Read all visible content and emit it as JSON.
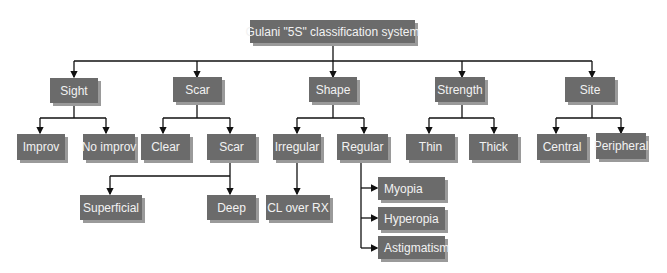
{
  "diagram": {
    "title": "Gulani \"5S\" classification system",
    "colors": {
      "box_fill": "#6b6b6b",
      "box_text": "#f2f2f2",
      "box_shadow": "#9a9a9a",
      "line": "#111111"
    },
    "categories": [
      {
        "label": "Sight",
        "children": [
          {
            "label": "Improv"
          },
          {
            "label": "No improv"
          }
        ]
      },
      {
        "label": "Scar",
        "children": [
          {
            "label": "Clear"
          },
          {
            "label": "Scar",
            "children": [
              {
                "label": "Superficial"
              },
              {
                "label": "Deep"
              }
            ]
          }
        ]
      },
      {
        "label": "Shape",
        "children": [
          {
            "label": "Irregular",
            "children": [
              {
                "label": "CL over RX"
              }
            ]
          },
          {
            "label": "Regular",
            "children": [
              {
                "label": "Myopia"
              },
              {
                "label": "Hyperopia"
              },
              {
                "label": "Astigmatism"
              }
            ]
          }
        ]
      },
      {
        "label": "Strength",
        "children": [
          {
            "label": "Thin"
          },
          {
            "label": "Thick"
          }
        ]
      },
      {
        "label": "Site",
        "children": [
          {
            "label": "Central"
          },
          {
            "label": "Peripheral"
          }
        ]
      }
    ]
  }
}
